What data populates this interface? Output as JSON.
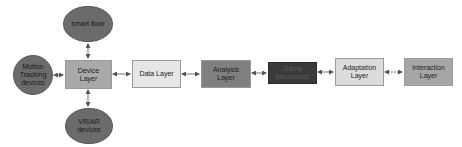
{
  "diagram": {
    "type": "flow",
    "nodes": [
      {
        "id": "smart_floor",
        "label": "smart floor",
        "shape": "ellipse",
        "color": "#6b6b6b"
      },
      {
        "id": "motion",
        "label": "Motion Tracking devices",
        "shape": "ellipse",
        "color": "#6b6b6b"
      },
      {
        "id": "vrar",
        "label": "VR/AR devices",
        "shape": "ellipse",
        "color": "#6b6b6b"
      },
      {
        "id": "device",
        "label": "Device Layer",
        "shape": "box",
        "color": "#a9a9a9"
      },
      {
        "id": "data",
        "label": "Data Layer",
        "shape": "box",
        "color": "#e6e6e6"
      },
      {
        "id": "analysis",
        "label": "Analysis Layer",
        "shape": "box",
        "color": "#7f7f7f"
      },
      {
        "id": "game",
        "label": "Game Mechanics",
        "shape": "box",
        "color": "#3a3a3a"
      },
      {
        "id": "adaptation",
        "label": "Adaptation Layer",
        "shape": "box",
        "color": "#dcdcdc"
      },
      {
        "id": "interaction",
        "label": "Interaction Layer",
        "shape": "box",
        "color": "#a6a6a6"
      }
    ],
    "edges": [
      {
        "from": "smart_floor",
        "to": "device",
        "direction": "both"
      },
      {
        "from": "motion",
        "to": "device",
        "direction": "both"
      },
      {
        "from": "vrar",
        "to": "device",
        "direction": "both"
      },
      {
        "from": "device",
        "to": "data",
        "direction": "both"
      },
      {
        "from": "data",
        "to": "analysis",
        "direction": "both"
      },
      {
        "from": "analysis",
        "to": "game",
        "direction": "both"
      },
      {
        "from": "game",
        "to": "adaptation",
        "direction": "both"
      },
      {
        "from": "adaptation",
        "to": "interaction",
        "direction": "both"
      }
    ]
  },
  "labels": {
    "smart_floor": "smart floor",
    "motion_1": "Motion",
    "motion_2": "Tracking",
    "motion_3": "devices",
    "vrar_1": "VR/AR",
    "vrar_2": "devices",
    "device_1": "Device",
    "device_2": "Layer",
    "data": "Data Layer",
    "analysis_1": "Analysis",
    "analysis_2": "Layer",
    "game_1": "Game",
    "game_2": "Mechanics",
    "adaptation_1": "Adaptation",
    "adaptation_2": "Layer",
    "interaction_1": "Interaction",
    "interaction_2": "Layer"
  }
}
